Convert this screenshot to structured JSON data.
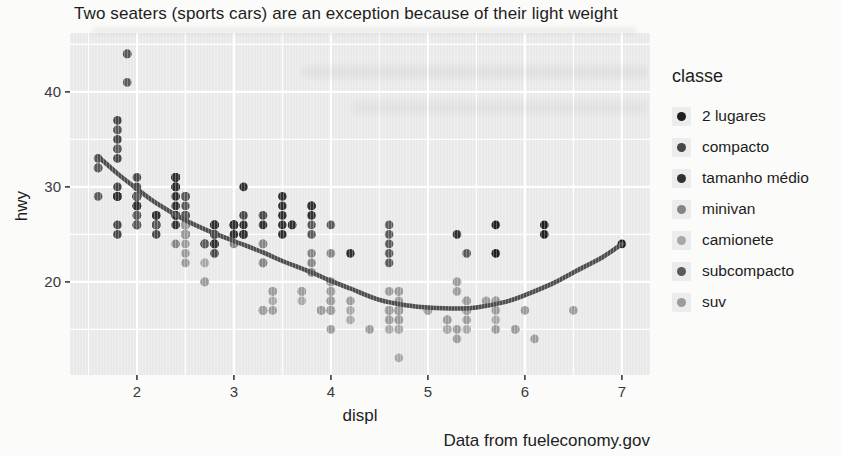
{
  "chart_data": {
    "type": "scatter",
    "title": "Two seaters (sports cars) are an exception because of their light weight",
    "caption": "Data from fueleconomy.gov",
    "xlabel": "displ",
    "ylabel": "hwy",
    "x_ticks": [
      2,
      3,
      4,
      5,
      6,
      7
    ],
    "y_ticks": [
      20,
      30,
      40
    ],
    "x_range": [
      1.31,
      7.29
    ],
    "y_range": [
      10.2,
      46.2
    ],
    "grid": {
      "minor_x": [
        1.5,
        2.5,
        3.5,
        4.5,
        5.5,
        6.5
      ],
      "minor_y": [
        15,
        25,
        35,
        45
      ]
    },
    "grid_on": true,
    "grid_color": "#ffffff",
    "panel_bg": "#e9e9e9",
    "tick_color": "#3a3a3a",
    "tick_label_color": "#3a3a3a",
    "legend_position": "right",
    "legend_title": "classe",
    "point_radius": 4.3,
    "smooth_line": {
      "color": "#4d4d4d",
      "width": 4.5,
      "points": [
        [
          1.6,
          33.2
        ],
        [
          1.8,
          31.4
        ],
        [
          2.0,
          29.8
        ],
        [
          2.2,
          28.3
        ],
        [
          2.5,
          26.5
        ],
        [
          2.8,
          25.1
        ],
        [
          3.0,
          24.3
        ],
        [
          3.3,
          23.1
        ],
        [
          3.5,
          22.2
        ],
        [
          3.8,
          21.0
        ],
        [
          4.0,
          20.1
        ],
        [
          4.2,
          19.3
        ],
        [
          4.5,
          18.1
        ],
        [
          4.8,
          17.5
        ],
        [
          5.0,
          17.3
        ],
        [
          5.3,
          17.2
        ],
        [
          5.5,
          17.3
        ],
        [
          5.8,
          17.9
        ],
        [
          6.0,
          18.6
        ],
        [
          6.3,
          19.9
        ],
        [
          6.5,
          21.0
        ],
        [
          6.8,
          22.6
        ],
        [
          7.0,
          24.0
        ]
      ]
    },
    "series": [
      {
        "name": "2 lugares",
        "color": "#1f1f1f",
        "points": [
          [
            5.7,
            26
          ],
          [
            5.7,
            23
          ],
          [
            6.2,
            26
          ],
          [
            6.2,
            25
          ],
          [
            7.0,
            24
          ]
        ]
      },
      {
        "name": "compacto",
        "color": "#474747",
        "points": [
          [
            1.8,
            29
          ],
          [
            1.8,
            29
          ],
          [
            2.0,
            31
          ],
          [
            2.0,
            30
          ],
          [
            2.8,
            26
          ],
          [
            2.8,
            26
          ],
          [
            3.1,
            27
          ],
          [
            1.8,
            26
          ],
          [
            1.8,
            25
          ],
          [
            2.0,
            28
          ],
          [
            2.0,
            27
          ],
          [
            2.8,
            25
          ],
          [
            2.8,
            25
          ],
          [
            3.1,
            25
          ],
          [
            3.1,
            25
          ],
          [
            2.2,
            26
          ],
          [
            2.2,
            27
          ],
          [
            2.4,
            30
          ],
          [
            2.4,
            31
          ],
          [
            3.0,
            26
          ],
          [
            3.0,
            26
          ],
          [
            3.3,
            27
          ],
          [
            1.8,
            30
          ],
          [
            1.8,
            33
          ],
          [
            1.8,
            34
          ],
          [
            1.8,
            35
          ],
          [
            1.8,
            37
          ],
          [
            2.0,
            29
          ],
          [
            2.0,
            29
          ],
          [
            2.0,
            28
          ],
          [
            2.0,
            29
          ],
          [
            2.8,
            24
          ],
          [
            1.9,
            44
          ],
          [
            2.0,
            29
          ],
          [
            2.0,
            29
          ],
          [
            2.0,
            28
          ],
          [
            2.0,
            29
          ],
          [
            2.5,
            29
          ],
          [
            2.5,
            29
          ],
          [
            2.8,
            23
          ],
          [
            2.8,
            24
          ],
          [
            2.2,
            26
          ],
          [
            2.2,
            25
          ],
          [
            2.5,
            25
          ],
          [
            2.5,
            25
          ],
          [
            2.5,
            26
          ],
          [
            2.5,
            27
          ]
        ]
      },
      {
        "name": "tamanho médio",
        "color": "#303030",
        "points": [
          [
            2.8,
            24
          ],
          [
            3.1,
            25
          ],
          [
            4.2,
            23
          ],
          [
            2.4,
            27
          ],
          [
            2.4,
            30
          ],
          [
            3.1,
            26
          ],
          [
            3.5,
            29
          ],
          [
            3.6,
            26
          ],
          [
            2.4,
            26
          ],
          [
            2.4,
            27
          ],
          [
            2.4,
            30
          ],
          [
            2.4,
            31
          ],
          [
            3.3,
            26
          ],
          [
            2.4,
            29
          ],
          [
            2.4,
            31
          ],
          [
            2.5,
            26
          ],
          [
            2.5,
            27
          ],
          [
            3.5,
            26
          ],
          [
            3.5,
            27
          ],
          [
            3.0,
            26
          ],
          [
            3.0,
            25
          ],
          [
            3.5,
            25
          ],
          [
            2.2,
            26
          ],
          [
            2.2,
            27
          ],
          [
            2.4,
            28
          ],
          [
            2.4,
            31
          ],
          [
            3.0,
            26
          ],
          [
            3.0,
            26
          ],
          [
            3.5,
            28
          ],
          [
            1.8,
            29
          ],
          [
            1.8,
            29
          ],
          [
            2.0,
            28
          ],
          [
            2.0,
            29
          ],
          [
            2.8,
            26
          ],
          [
            2.8,
            26
          ],
          [
            3.6,
            26
          ],
          [
            3.1,
            30
          ],
          [
            3.8,
            28
          ],
          [
            3.8,
            28
          ],
          [
            3.8,
            27
          ],
          [
            5.3,
            25
          ]
        ]
      },
      {
        "name": "minivan",
        "color": "#858585",
        "points": [
          [
            2.4,
            24
          ],
          [
            3.0,
            24
          ],
          [
            3.3,
            22
          ],
          [
            3.3,
            22
          ],
          [
            3.3,
            24
          ],
          [
            3.3,
            24
          ],
          [
            3.3,
            17
          ],
          [
            3.8,
            22
          ],
          [
            3.8,
            21
          ],
          [
            3.8,
            23
          ],
          [
            4.0,
            23
          ]
        ]
      },
      {
        "name": "camionete",
        "color": "#a8a8a8",
        "points": [
          [
            3.7,
            19
          ],
          [
            3.7,
            18
          ],
          [
            3.9,
            17
          ],
          [
            3.9,
            17
          ],
          [
            4.7,
            16
          ],
          [
            4.7,
            16
          ],
          [
            4.7,
            15
          ],
          [
            5.2,
            15
          ],
          [
            5.2,
            16
          ],
          [
            4.7,
            12
          ],
          [
            4.7,
            17
          ],
          [
            4.7,
            16
          ],
          [
            4.7,
            15
          ],
          [
            4.7,
            16
          ],
          [
            4.7,
            17
          ],
          [
            5.2,
            15
          ],
          [
            5.2,
            16
          ],
          [
            5.7,
            16
          ],
          [
            5.9,
            15
          ],
          [
            4.2,
            17
          ],
          [
            4.2,
            16
          ],
          [
            4.6,
            16
          ],
          [
            4.6,
            15
          ],
          [
            4.6,
            17
          ],
          [
            5.4,
            17
          ],
          [
            5.4,
            15
          ],
          [
            2.7,
            22
          ],
          [
            2.7,
            20
          ],
          [
            2.7,
            22
          ],
          [
            3.4,
            19
          ],
          [
            3.4,
            18
          ],
          [
            4.0,
            20
          ],
          [
            4.0,
            18
          ]
        ]
      },
      {
        "name": "subcompacto",
        "color": "#5a5a5a",
        "points": [
          [
            1.6,
            33
          ],
          [
            1.6,
            32
          ],
          [
            1.6,
            32
          ],
          [
            1.6,
            29
          ],
          [
            1.6,
            32
          ],
          [
            1.8,
            34
          ],
          [
            1.8,
            36
          ],
          [
            1.8,
            36
          ],
          [
            2.0,
            29
          ],
          [
            2.0,
            26
          ],
          [
            2.0,
            27
          ],
          [
            2.0,
            26
          ],
          [
            2.0,
            26
          ],
          [
            2.7,
            24
          ],
          [
            2.7,
            24
          ],
          [
            2.7,
            24
          ],
          [
            3.8,
            26
          ],
          [
            3.8,
            25
          ],
          [
            4.0,
            26
          ],
          [
            4.6,
            24
          ],
          [
            4.6,
            25
          ],
          [
            4.6,
            26
          ],
          [
            4.6,
            23
          ],
          [
            4.6,
            22
          ],
          [
            5.4,
            23
          ],
          [
            1.9,
            44
          ],
          [
            1.9,
            41
          ],
          [
            2.0,
            29
          ],
          [
            2.0,
            26
          ],
          [
            2.5,
            28
          ],
          [
            2.5,
            29
          ],
          [
            2.2,
            26
          ],
          [
            2.5,
            25
          ],
          [
            2.5,
            27
          ],
          [
            2.5,
            26
          ]
        ]
      },
      {
        "name": "suv",
        "color": "#9b9b9b",
        "points": [
          [
            5.3,
            20
          ],
          [
            5.3,
            15
          ],
          [
            5.3,
            20
          ],
          [
            5.7,
            17
          ],
          [
            6.0,
            17
          ],
          [
            5.3,
            19
          ],
          [
            5.3,
            14
          ],
          [
            5.7,
            15
          ],
          [
            6.5,
            17
          ],
          [
            3.9,
            17
          ],
          [
            4.7,
            17
          ],
          [
            4.7,
            17
          ],
          [
            4.7,
            18
          ],
          [
            4.7,
            16
          ],
          [
            5.2,
            16
          ],
          [
            5.9,
            15
          ],
          [
            4.0,
            17
          ],
          [
            4.0,
            17
          ],
          [
            4.0,
            18
          ],
          [
            4.0,
            19
          ],
          [
            4.6,
            17
          ],
          [
            5.0,
            17
          ],
          [
            4.6,
            17
          ],
          [
            5.4,
            17
          ],
          [
            5.4,
            18
          ],
          [
            2.5,
            26
          ],
          [
            2.5,
            25
          ],
          [
            2.5,
            24
          ],
          [
            2.5,
            23
          ],
          [
            2.5,
            25
          ],
          [
            2.5,
            22
          ],
          [
            2.7,
            20
          ],
          [
            2.7,
            20
          ],
          [
            3.4,
            19
          ],
          [
            3.4,
            17
          ],
          [
            4.0,
            20
          ],
          [
            4.7,
            17
          ],
          [
            4.7,
            17
          ],
          [
            5.7,
            18
          ],
          [
            3.3,
            17
          ],
          [
            3.3,
            17
          ],
          [
            4.0,
            18
          ],
          [
            5.6,
            18
          ],
          [
            3.7,
            19
          ],
          [
            4.0,
            20
          ],
          [
            4.7,
            17
          ],
          [
            4.7,
            19
          ],
          [
            4.7,
            19
          ],
          [
            4.7,
            17
          ],
          [
            5.7,
            18
          ],
          [
            6.1,
            14
          ],
          [
            4.0,
            15
          ],
          [
            4.2,
            18
          ],
          [
            4.4,
            15
          ],
          [
            4.6,
            16
          ],
          [
            5.4,
            17
          ],
          [
            5.4,
            16
          ],
          [
            5.4,
            18
          ],
          [
            4.0,
            17
          ],
          [
            4.0,
            19
          ],
          [
            4.6,
            19
          ],
          [
            5.0,
            17
          ]
        ]
      }
    ]
  }
}
